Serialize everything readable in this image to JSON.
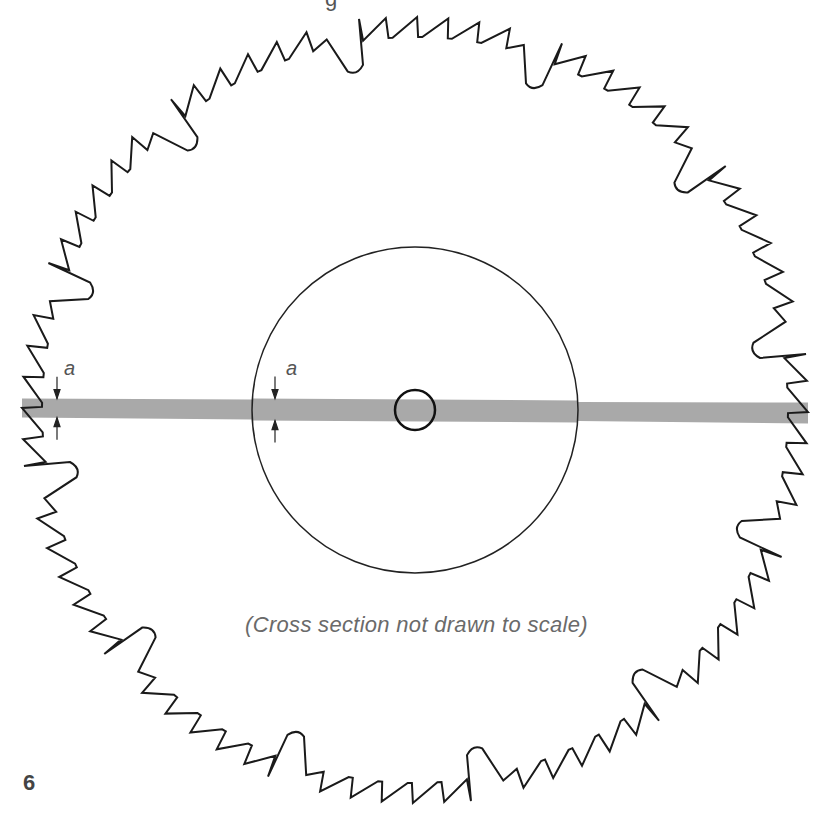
{
  "figure": {
    "number": "6",
    "caption": "(Cross section not drawn to scale)",
    "top_partial_glyph": "g",
    "labels": {
      "dim_left": "a",
      "dim_hub": "a"
    }
  },
  "blade": {
    "center": [
      415,
      410
    ],
    "outer_radius": 393,
    "gullet_depth": 48,
    "tooth_height": 20,
    "teeth_per_group": 5,
    "groups": 12,
    "rotation_deg": -8,
    "stroke_color": "#1a1a1a"
  },
  "hub": {
    "radius": 163,
    "stroke_color": "#222222"
  },
  "arbor_hole": {
    "radius": 20,
    "stroke_color": "#111111"
  },
  "cross_section": {
    "x_start": 22,
    "x_end": 808,
    "outer_thickness_left": 19,
    "hub_thickness": 22,
    "outer_thickness_right": 21,
    "center_y_left": 408,
    "center_y_right": 413,
    "color": "#a9a9a9"
  }
}
